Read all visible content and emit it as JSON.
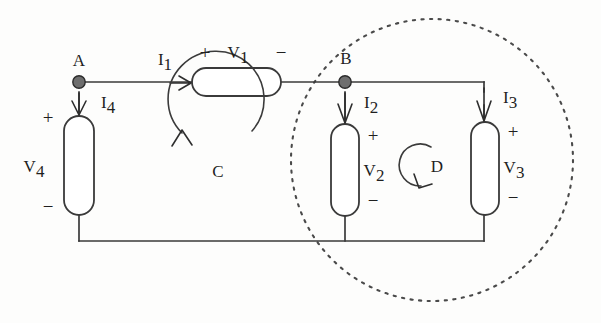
{
  "diagram": {
    "type": "electrical-circuit",
    "nodes": [
      {
        "id": "A",
        "label": "A",
        "x": 79,
        "y": 82
      },
      {
        "id": "B",
        "label": "B",
        "x": 345,
        "y": 80
      }
    ],
    "components": [
      {
        "id": "R1",
        "voltage_label": "V",
        "voltage_sub": "1",
        "orientation": "horizontal",
        "plus": "+",
        "minus": "−"
      },
      {
        "id": "R2",
        "voltage_label": "V",
        "voltage_sub": "2",
        "orientation": "vertical",
        "plus": "+",
        "minus": "−"
      },
      {
        "id": "R3",
        "voltage_label": "V",
        "voltage_sub": "3",
        "orientation": "vertical",
        "plus": "+",
        "minus": "−"
      },
      {
        "id": "R4",
        "voltage_label": "V",
        "voltage_sub": "4",
        "orientation": "vertical",
        "plus": "+",
        "minus": "−"
      }
    ],
    "currents": [
      {
        "id": "I1",
        "label": "I",
        "sub": "1",
        "direction": "right"
      },
      {
        "id": "I2",
        "label": "I",
        "sub": "2",
        "direction": "down"
      },
      {
        "id": "I3",
        "label": "I",
        "sub": "3",
        "direction": "down"
      },
      {
        "id": "I4",
        "label": "I",
        "sub": "4",
        "direction": "down"
      }
    ],
    "loops": [
      {
        "id": "C",
        "label": "C",
        "direction": "counterclockwise"
      },
      {
        "id": "D",
        "label": "D",
        "direction": "counterclockwise"
      }
    ],
    "region": {
      "id": "dotted-boundary",
      "style": "dotted-circle"
    },
    "labels": {
      "node_a": "A",
      "node_b": "B",
      "v1": "V",
      "v1_sub": "1",
      "v2": "V",
      "v2_sub": "2",
      "v3": "V",
      "v3_sub": "3",
      "v4": "V",
      "v4_sub": "4",
      "i1": "I",
      "i1_sub": "1",
      "i2": "I",
      "i2_sub": "2",
      "i3": "I",
      "i3_sub": "3",
      "i4": "I",
      "i4_sub": "4",
      "loop_c": "C",
      "loop_d": "D",
      "plus": "+",
      "minus": "−"
    },
    "colors": {
      "wire": "#3a3a3a",
      "node_fill": "#6e6e6e",
      "text": "#1f1f1f",
      "dotted": "#4a4a4a",
      "background": "#fdfdfc"
    }
  }
}
